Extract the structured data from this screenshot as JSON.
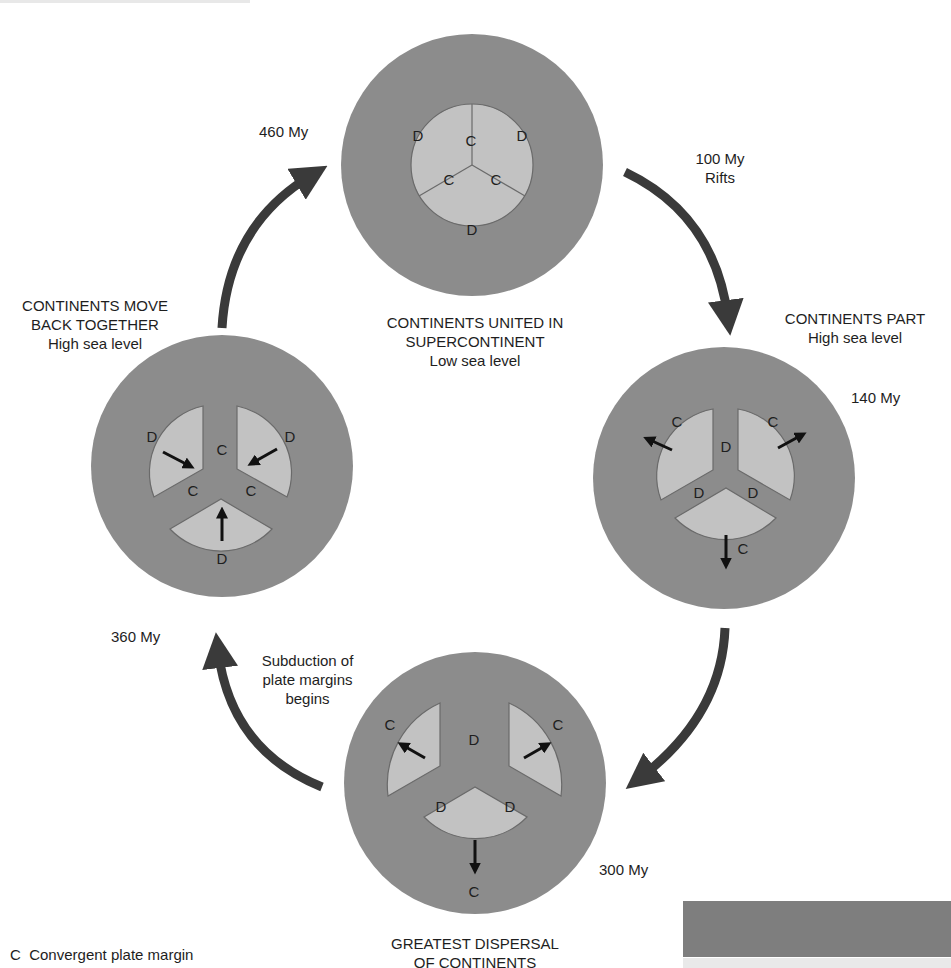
{
  "colors": {
    "ocean": "#8c8c8c",
    "continent": "#c2c2c2",
    "continent_outline": "#6a6a6a",
    "cycle_arrow": "#3a3a3a",
    "motion_arrow": "#111111",
    "text": "#1e1e1e"
  },
  "stages": [
    {
      "id": "united",
      "age": "460 My",
      "caption": [
        "CONTINENTS UNITED IN",
        "SUPERCONTINENT",
        "Low sea level"
      ],
      "margin_labels": [
        "D",
        "C",
        "D",
        "C",
        "C",
        "D"
      ],
      "motion_arrows": []
    },
    {
      "id": "part",
      "age": "140 My",
      "caption": [
        "CONTINENTS PART",
        "High sea level"
      ],
      "margin_labels": [
        "C",
        "D",
        "C",
        "D",
        "D",
        "C"
      ],
      "motion_arrows": [
        "up-left",
        "up-right",
        "down"
      ]
    },
    {
      "id": "dispersal",
      "age": "300 My",
      "caption": [
        "GREATEST DISPERSAL",
        "OF CONTINENTS"
      ],
      "margin_labels": [
        "C",
        "D",
        "C",
        "D",
        "D",
        "C"
      ],
      "motion_arrows": [
        "up-left",
        "up-right",
        "down"
      ]
    },
    {
      "id": "together",
      "age": "360 My",
      "caption": [
        "CONTINENTS MOVE",
        "BACK TOGETHER",
        "High sea level"
      ],
      "margin_labels": [
        "D",
        "C",
        "D",
        "C",
        "C",
        "D"
      ],
      "motion_arrows": [
        "down-right",
        "down-left",
        "up"
      ]
    }
  ],
  "transitions": [
    {
      "from": "united",
      "to": "part",
      "label": [
        "100 My",
        "Rifts"
      ]
    },
    {
      "from": "part",
      "to": "dispersal",
      "label": []
    },
    {
      "from": "dispersal",
      "to": "together",
      "label": [
        "Subduction of",
        "plate margins",
        "begins"
      ]
    },
    {
      "from": "together",
      "to": "united",
      "label": []
    }
  ],
  "legend": {
    "items": [
      {
        "symbol": "C",
        "text": "Convergent plate margin"
      }
    ]
  }
}
